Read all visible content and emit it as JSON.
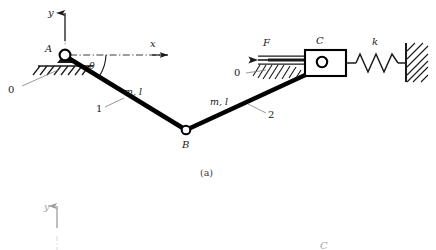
{
  "figure": {
    "caption_a": "(a)",
    "panel_a": {
      "axes": {
        "y_label": "y",
        "x_label": "x"
      },
      "joints": {
        "a_label": "A",
        "b_label": "B",
        "c_label": "C"
      },
      "angle_label": "θ",
      "ground_label_left": "0",
      "ground_label_right": "0",
      "link1": {
        "number": "1",
        "props": "m, l"
      },
      "link2": {
        "number": "2",
        "props": "m, l"
      },
      "force_label": "F",
      "spring_label": "k"
    },
    "panel_b": {
      "axes": {
        "y_label": "y"
      },
      "joints": {
        "c_label": "C"
      }
    }
  },
  "colors": {
    "ink": "#1a1a1a",
    "link": "#000000",
    "thin": "#2b2b2b",
    "caption": "#3a3a3a",
    "background": "#ffffff"
  }
}
